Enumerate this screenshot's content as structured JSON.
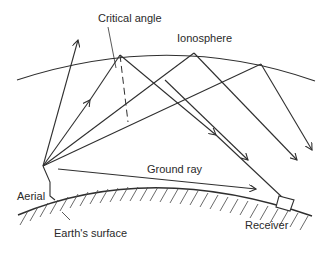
{
  "diagram": {
    "labels": {
      "critical_angle": "Critical angle",
      "ionosphere": "Ionosphere",
      "ground_ray": "Ground ray",
      "aerial": "Aerial",
      "earths_surface": "Earth's surface",
      "receiver": "Receiver"
    },
    "elements": [
      "ionosphere-layer",
      "earth-surface",
      "aerial",
      "receiver",
      "escaping-ray",
      "critical-angle-ray",
      "reflected-rays",
      "ground-ray"
    ],
    "colors": {
      "line": "#2f2f2f",
      "background": "#ffffff"
    }
  }
}
